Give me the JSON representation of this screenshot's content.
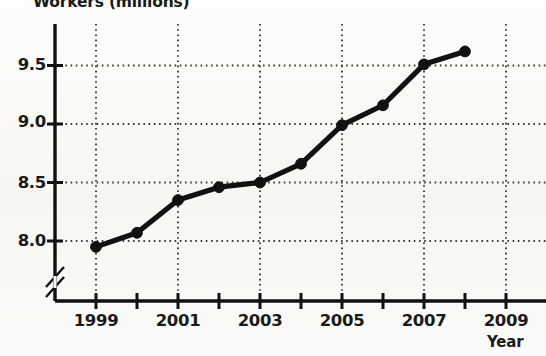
{
  "chart_data": {
    "type": "line",
    "title": "Workers (millions)",
    "xlabel": "Year",
    "ylabel": "Workers (millions)",
    "x": [
      1999,
      2000,
      2001,
      2002,
      2003,
      2004,
      2005,
      2006,
      2007,
      2008
    ],
    "values": [
      7.95,
      8.07,
      8.35,
      8.46,
      8.5,
      8.66,
      8.99,
      9.16,
      9.51,
      9.62
    ],
    "series": [
      {
        "name": "Workers",
        "values": [
          7.95,
          8.07,
          8.35,
          8.46,
          8.5,
          8.66,
          8.99,
          9.16,
          9.51,
          9.62
        ]
      }
    ],
    "xlim": [
      1998,
      2009.6
    ],
    "ylim": [
      7.72,
      9.78
    ],
    "y_ticks": [
      8.0,
      8.5,
      9.0,
      9.5
    ],
    "y_tick_labels": [
      "8.0",
      "8.5",
      "9.0",
      "9.5"
    ],
    "x_ticks": [
      1999,
      2000,
      2001,
      2002,
      2003,
      2004,
      2005,
      2006,
      2007,
      2008,
      2009
    ],
    "x_tick_labels_shown": [
      "1999",
      "2001",
      "2003",
      "2005",
      "2007",
      "2009"
    ],
    "x_labeled_ticks": [
      1999,
      2001,
      2003,
      2005,
      2007,
      2009
    ],
    "grid": true,
    "grid_style": "dotted",
    "grid_x_at": [
      1999,
      2001,
      2003,
      2005,
      2007,
      2009
    ],
    "grid_y_at": [
      8.0,
      8.5,
      9.0,
      9.5
    ],
    "axis_break": true,
    "axis_break_axis": "y",
    "marker": "circle",
    "line_color": "#111111",
    "marker_color": "#111111",
    "grid_color": "#3a3a3a",
    "axis_color": "#111111",
    "legend": null,
    "legend_position": "none"
  },
  "labels": {
    "y_title": "Workers (millions)",
    "x_title": "Year",
    "y_0": "8.0",
    "y_1": "8.5",
    "y_2": "9.0",
    "y_3": "9.5",
    "x_1999": "1999",
    "x_2001": "2001",
    "x_2003": "2003",
    "x_2005": "2005",
    "x_2007": "2007",
    "x_2009": "2009"
  }
}
